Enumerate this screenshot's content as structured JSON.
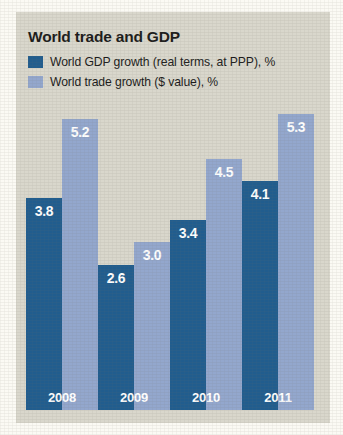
{
  "chart_data": {
    "type": "bar",
    "title": "World trade and GDP",
    "xlabel": "",
    "ylabel": "",
    "ylim": [
      0,
      6.8
    ],
    "grid": false,
    "legend_position": "top-left",
    "categories": [
      "2008",
      "2009",
      "2010",
      "2011"
    ],
    "series": [
      {
        "name": "World GDP growth (real terms, at PPP), %",
        "color": "#215d8e",
        "label_color": "#ffffff",
        "values": [
          3.8,
          2.6,
          3.4,
          4.1
        ],
        "value_labels": [
          "3.8",
          "2.6",
          "3.4",
          "4.1"
        ]
      },
      {
        "name": "World trade growth ($ value), %",
        "color": "#93a7cd",
        "label_color": "#ffffff",
        "values": [
          5.2,
          3.0,
          4.5,
          5.3
        ],
        "value_labels": [
          "5.2",
          "3.0",
          "4.5",
          "5.3"
        ]
      }
    ],
    "annotations": []
  },
  "colors": {
    "panel_background": "#d9d7cc",
    "page_background": "#fbfaf4",
    "series_gdp": "#215d8e",
    "series_trade": "#93a7cd",
    "title_text": "#1b1b1b",
    "value_text": "#ffffff"
  }
}
